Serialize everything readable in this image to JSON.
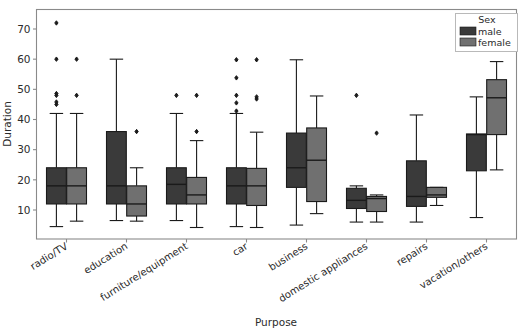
{
  "chart_data": {
    "type": "box",
    "title": "",
    "xlabel": "Purpose",
    "ylabel": "Duration",
    "categories": [
      "radio/TV",
      "education",
      "furniture/equipment",
      "car",
      "business",
      "domestic appliances",
      "repairs",
      "vacation/others"
    ],
    "ylim": [
      2,
      75
    ],
    "yticks": [
      10,
      20,
      30,
      40,
      50,
      60,
      70
    ],
    "grid": false,
    "legend": {
      "title": "Sex",
      "position": "upper right",
      "entries": [
        {
          "label": "male",
          "color": "#3a3a3a"
        },
        {
          "label": "female",
          "color": "#707070"
        }
      ]
    },
    "series": [
      {
        "name": "male",
        "color": "#3a3a3a",
        "boxes": [
          {
            "category": "radio/TV",
            "whisker_low": 4.5,
            "q1": 12,
            "median": 18,
            "q3": 24,
            "whisker_high": 42,
            "fliers": [
              45,
              45.8,
              48,
              48.6,
              60,
              72
            ]
          },
          {
            "category": "education",
            "whisker_low": 6.5,
            "q1": 12,
            "median": 18,
            "q3": 36,
            "whisker_high": 60,
            "fliers": []
          },
          {
            "category": "furniture/equipment",
            "whisker_low": 6.5,
            "q1": 12,
            "median": 18.5,
            "q3": 24,
            "whisker_high": 42,
            "fliers": [
              48
            ]
          },
          {
            "category": "car",
            "whisker_low": 4.5,
            "q1": 12,
            "median": 18,
            "q3": 24,
            "whisker_high": 42,
            "fliers": [
              42.8,
              45.5,
              48,
              53.8,
              59.8
            ]
          },
          {
            "category": "business",
            "whisker_low": 5,
            "q1": 17.5,
            "median": 24,
            "q3": 35.5,
            "whisker_high": 59.8,
            "fliers": []
          },
          {
            "category": "domestic appliances",
            "whisker_low": 6,
            "q1": 10.5,
            "median": 13.2,
            "q3": 17.2,
            "whisker_high": 18,
            "fliers": [
              48
            ]
          },
          {
            "category": "repairs",
            "whisker_low": 6,
            "q1": 11.2,
            "median": 14.5,
            "q3": 26.3,
            "whisker_high": 41.5,
            "fliers": []
          },
          {
            "category": "vacation/others",
            "whisker_low": 7.5,
            "q1": 23,
            "median": 35,
            "q3": 35.2,
            "whisker_high": 47.5,
            "fliers": []
          }
        ]
      },
      {
        "name": "female",
        "color": "#707070",
        "boxes": [
          {
            "category": "radio/TV",
            "whisker_low": 6.3,
            "q1": 12,
            "median": 18,
            "q3": 24,
            "whisker_high": 42,
            "fliers": [
              48,
              60
            ]
          },
          {
            "category": "education",
            "whisker_low": 6.3,
            "q1": 8,
            "median": 12,
            "q3": 18,
            "whisker_high": 24,
            "fliers": [
              36
            ]
          },
          {
            "category": "furniture/equipment",
            "whisker_low": 4.2,
            "q1": 12,
            "median": 15,
            "q3": 20.8,
            "whisker_high": 33,
            "fliers": [
              36,
              48
            ]
          },
          {
            "category": "car",
            "whisker_low": 4.2,
            "q1": 11.5,
            "median": 18,
            "q3": 23.8,
            "whisker_high": 35.8,
            "fliers": [
              46.8,
              47.5,
              59.8
            ]
          },
          {
            "category": "business",
            "whisker_low": 8.8,
            "q1": 12.8,
            "median": 26.5,
            "q3": 37.2,
            "whisker_high": 47.8,
            "fliers": []
          },
          {
            "category": "domestic appliances",
            "whisker_low": 6,
            "q1": 9.5,
            "median": 13.8,
            "q3": 14.5,
            "whisker_high": 15,
            "fliers": [
              35.5
            ]
          },
          {
            "category": "repairs",
            "whisker_low": 11.5,
            "q1": 14.2,
            "median": 15,
            "q3": 17.5,
            "whisker_high": 17.5,
            "fliers": []
          },
          {
            "category": "vacation/others",
            "whisker_low": 23.3,
            "q1": 35,
            "median": 47.2,
            "q3": 53.2,
            "whisker_high": 59.2,
            "fliers": []
          }
        ]
      }
    ]
  },
  "axes": {
    "ylabel": "Duration",
    "xlabel": "Purpose",
    "ytick_labels": [
      "10",
      "20",
      "30",
      "40",
      "50",
      "60",
      "70"
    ],
    "xtick_labels": [
      "radio/TV",
      "education",
      "furniture/equipment",
      "car",
      "business",
      "domestic appliances",
      "repairs",
      "vacation/others"
    ]
  },
  "legend": {
    "title": "Sex",
    "items": [
      "male",
      "female"
    ]
  },
  "colors": {
    "male": "#3a3a3a",
    "female": "#707070",
    "spine": "#8a8a8a",
    "line": "#1a1a1a",
    "background": "#ffffff"
  }
}
